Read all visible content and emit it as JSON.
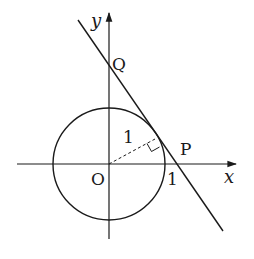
{
  "diagram": {
    "labels": {
      "y_axis": "y",
      "x_axis": "x",
      "origin": "O",
      "point_q": "Q",
      "point_p": "P",
      "radius": "1",
      "x_intercept": "1"
    },
    "stroke_color": "#1a1a1a",
    "background": "#ffffff"
  }
}
